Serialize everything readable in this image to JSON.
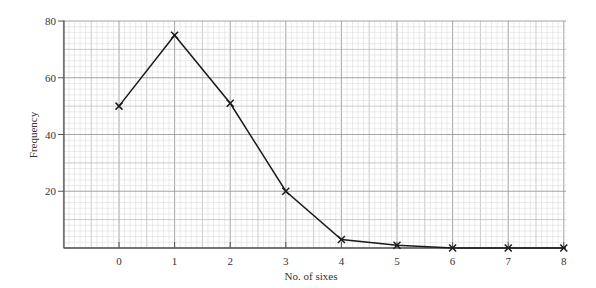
{
  "chart_data": {
    "type": "line",
    "title": "",
    "xlabel": "No. of sixes",
    "ylabel": "Frequency",
    "x": [
      0,
      1,
      2,
      3,
      4,
      5,
      6,
      7,
      8
    ],
    "values": [
      50,
      75,
      51,
      20,
      3,
      1,
      0,
      0,
      0
    ],
    "series": [
      {
        "name": "Frequency",
        "marker": "cross",
        "x": [
          0,
          1,
          2,
          3,
          4,
          5,
          6,
          7,
          8
        ],
        "values": [
          50,
          75,
          51,
          20,
          3,
          1,
          0,
          0,
          0
        ]
      }
    ],
    "x_ticks": [
      "0",
      "1",
      "2",
      "3",
      "4",
      "5",
      "6",
      "7",
      "8"
    ],
    "y_ticks": [
      "20",
      "40",
      "60",
      "80"
    ],
    "xlim": [
      -1,
      8.05
    ],
    "ylim": [
      0,
      80
    ],
    "grid": true,
    "grid_style": "graph-paper",
    "legend": null
  },
  "colors": {
    "line": "#1a1a1a",
    "axis": "#555555",
    "grid_major": "#9a9a9a",
    "grid_minor": "#d6d6d6",
    "text": "#333333"
  }
}
